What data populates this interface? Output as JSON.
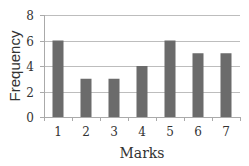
{
  "chart_data": {
    "type": "bar",
    "title": "",
    "xlabel": "Marks",
    "ylabel": "Frequency",
    "categories": [
      "1",
      "2",
      "3",
      "4",
      "5",
      "6",
      "7"
    ],
    "values": [
      6,
      3,
      3,
      4,
      6,
      5,
      5
    ],
    "ylim": [
      0,
      8
    ],
    "yticks": [
      "0",
      "2",
      "4",
      "6",
      "8"
    ],
    "grid": true,
    "legend": null,
    "colors": {
      "bar": "#6b6b6b",
      "grid": "#bdbdbd",
      "axis": "#aaaaaa"
    }
  }
}
